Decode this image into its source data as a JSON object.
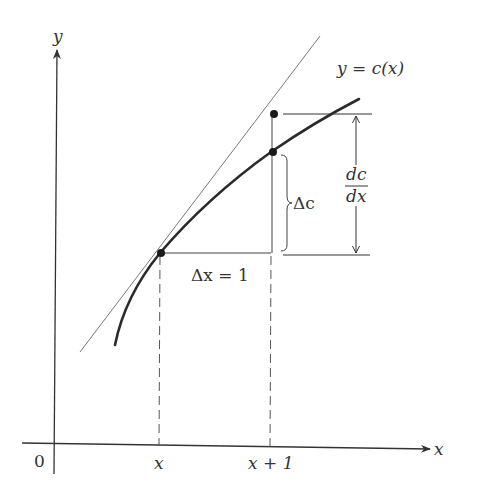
{
  "diagram": {
    "type": "marginal-cost-tangent",
    "axes": {
      "y_label": "y",
      "x_label": "x",
      "origin_label": "0"
    },
    "curve": {
      "label": "y = c(x)"
    },
    "tick_labels": {
      "x": "x",
      "x_plus_1": "x + 1"
    },
    "annotations": {
      "delta_x": "Δx = 1",
      "delta_c": "Δc",
      "derivative_num": "dc",
      "derivative_den": "dx"
    },
    "points": [
      {
        "name": "point-at-x",
        "on": "curve"
      },
      {
        "name": "point-at-x-plus-1-curve",
        "on": "curve"
      },
      {
        "name": "point-at-x-plus-1-tangent",
        "on": "tangent"
      }
    ],
    "colors": {
      "curve": "#2b2b2b",
      "tangent": "#7a7a7a",
      "axes": "#333333",
      "text": "#333333"
    }
  }
}
